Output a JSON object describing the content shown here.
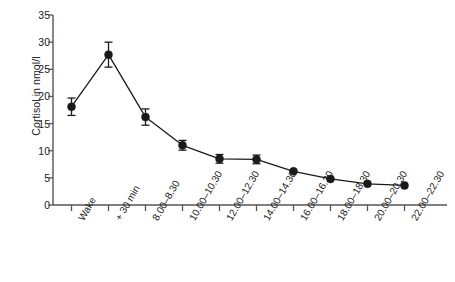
{
  "chart_data": {
    "type": "line",
    "title": "",
    "subtitle": "",
    "xlabel": "",
    "ylabel": "Cortisol in nmol/l",
    "categories": [
      "Wake",
      "+ 30 min",
      "8.00–8.30",
      "10.00–10.30",
      "12.00–12.30",
      "14.00–14.30",
      "16.00–16.30",
      "18.00–18.30",
      "20.00–20.30",
      "22.00–22.30"
    ],
    "values": [
      18.1,
      27.7,
      16.2,
      11.0,
      8.5,
      8.4,
      6.2,
      4.8,
      3.9,
      3.6
    ],
    "errors": [
      1.6,
      2.3,
      1.5,
      0.9,
      0.8,
      0.8,
      0,
      0,
      0,
      0
    ],
    "series": [
      {
        "name": "Cortisol",
        "values": [
          18.1,
          27.7,
          16.2,
          11.0,
          8.5,
          8.4,
          6.2,
          4.8,
          3.9,
          3.6
        ],
        "errors": [
          1.6,
          2.3,
          1.5,
          0.9,
          0.8,
          0.8,
          0,
          0,
          0,
          0
        ]
      }
    ],
    "ylim": [
      0,
      35
    ],
    "yticks": [
      0,
      5,
      10,
      15,
      20,
      25,
      30,
      35
    ],
    "ytick_labels": [
      "0",
      "5",
      "10",
      "15",
      "20",
      "25",
      "30",
      "35"
    ],
    "grid": false,
    "legend": false,
    "legend_position": "none",
    "marker": "filled-circle",
    "line_color": "#1a1a1a",
    "marker_color": "#1a1a1a",
    "axis_color": "#555555",
    "background_color": "#ffffff"
  }
}
